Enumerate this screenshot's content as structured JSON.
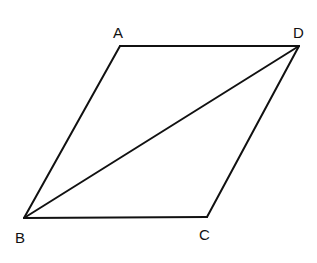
{
  "diagram": {
    "type": "parallelogram",
    "vertices": {
      "A": {
        "label": "A",
        "x": 120,
        "y": 46
      },
      "D": {
        "label": "D",
        "x": 299,
        "y": 46
      },
      "C": {
        "label": "C",
        "x": 207,
        "y": 217
      },
      "B": {
        "label": "B",
        "x": 24,
        "y": 218
      }
    },
    "edges": [
      "AD",
      "DC",
      "CB",
      "BA"
    ],
    "diagonals": [
      "BD"
    ],
    "stroke_color": "#111111"
  }
}
